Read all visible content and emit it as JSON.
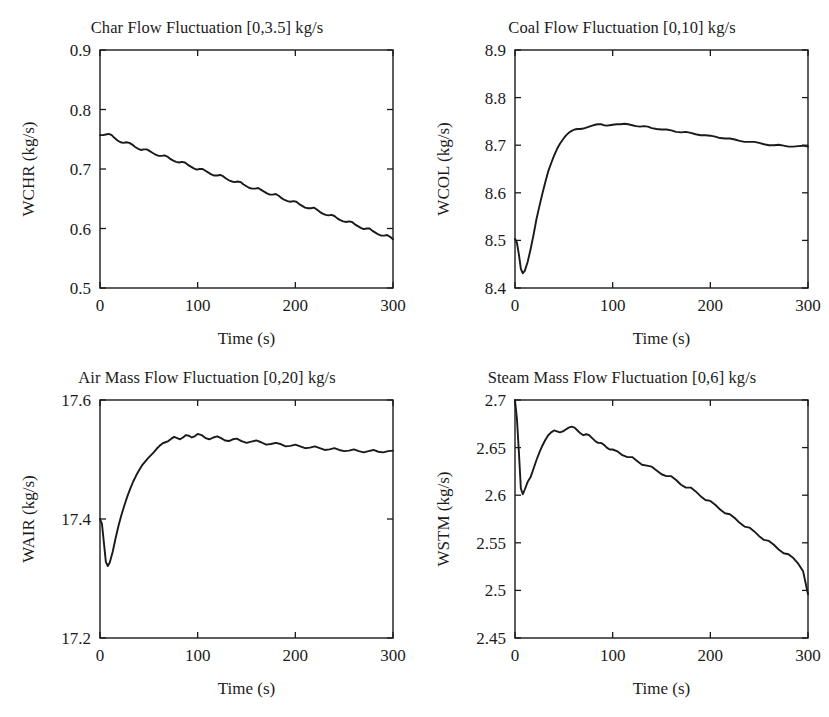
{
  "figure": {
    "width": 829,
    "height": 717,
    "background": "#ffffff",
    "line_color": "#1a1a1a",
    "axis_color": "#1a1a1a",
    "text_color": "#1b1b1b"
  },
  "chart_data": [
    {
      "id": "char-flow",
      "type": "line",
      "title": "Char Flow Fluctuation [0,3.5] kg/s",
      "xlabel": "Time (s)",
      "ylabel": "WCHR (kg/s)",
      "xlim": [
        0,
        300
      ],
      "ylim": [
        0.5,
        0.9
      ],
      "xticks": [
        0,
        100,
        200,
        300
      ],
      "xticklabels": [
        "0",
        "100",
        "200",
        "300"
      ],
      "yticks": [
        0.5,
        0.6,
        0.7,
        0.8,
        0.9
      ],
      "yticklabels": [
        "0.5",
        "0.6",
        "0.7",
        "0.8",
        "0.9"
      ],
      "grid": false,
      "legend": null,
      "series": [
        {
          "name": "WCHR",
          "x": [
            0,
            3,
            6,
            9,
            12,
            15,
            18,
            21,
            24,
            27,
            30,
            33,
            36,
            39,
            42,
            45,
            48,
            51,
            54,
            57,
            60,
            63,
            66,
            69,
            72,
            75,
            78,
            81,
            84,
            87,
            90,
            93,
            96,
            99,
            102,
            105,
            108,
            111,
            114,
            117,
            120,
            123,
            126,
            129,
            132,
            135,
            138,
            141,
            144,
            147,
            150,
            153,
            156,
            159,
            162,
            165,
            168,
            171,
            174,
            177,
            180,
            183,
            186,
            189,
            192,
            195,
            198,
            201,
            204,
            207,
            210,
            213,
            216,
            219,
            222,
            225,
            228,
            231,
            234,
            237,
            240,
            243,
            246,
            249,
            252,
            255,
            258,
            261,
            264,
            267,
            270,
            273,
            276,
            279,
            282,
            285,
            288,
            291,
            294,
            297,
            300
          ],
          "y": [
            0.757,
            0.757,
            0.758,
            0.759,
            0.757,
            0.752,
            0.748,
            0.745,
            0.744,
            0.745,
            0.744,
            0.741,
            0.737,
            0.734,
            0.732,
            0.733,
            0.733,
            0.73,
            0.727,
            0.724,
            0.722,
            0.722,
            0.723,
            0.721,
            0.717,
            0.714,
            0.712,
            0.711,
            0.712,
            0.711,
            0.707,
            0.704,
            0.701,
            0.699,
            0.7,
            0.7,
            0.697,
            0.694,
            0.691,
            0.689,
            0.689,
            0.69,
            0.688,
            0.684,
            0.681,
            0.679,
            0.678,
            0.679,
            0.678,
            0.674,
            0.671,
            0.668,
            0.667,
            0.667,
            0.668,
            0.665,
            0.662,
            0.659,
            0.657,
            0.657,
            0.658,
            0.655,
            0.651,
            0.648,
            0.646,
            0.645,
            0.646,
            0.645,
            0.641,
            0.638,
            0.635,
            0.634,
            0.634,
            0.635,
            0.632,
            0.628,
            0.625,
            0.623,
            0.622,
            0.623,
            0.621,
            0.617,
            0.614,
            0.612,
            0.611,
            0.612,
            0.611,
            0.607,
            0.604,
            0.601,
            0.599,
            0.6,
            0.6,
            0.596,
            0.593,
            0.59,
            0.588,
            0.588,
            0.589,
            0.586,
            0.582
          ]
        }
      ]
    },
    {
      "id": "coal-flow",
      "type": "line",
      "title": "Coal Flow Fluctuation [0,10] kg/s",
      "xlabel": "Time (s)",
      "ylabel": "WCOL (kg/s)",
      "xlim": [
        0,
        300
      ],
      "ylim": [
        8.4,
        8.9
      ],
      "xticks": [
        0,
        100,
        200,
        300
      ],
      "xticklabels": [
        "0",
        "100",
        "200",
        "300"
      ],
      "yticks": [
        8.4,
        8.5,
        8.6,
        8.7,
        8.8,
        8.9
      ],
      "yticklabels": [
        "8.4",
        "8.5",
        "8.6",
        "8.7",
        "8.8",
        "8.9"
      ],
      "grid": false,
      "legend": null,
      "series": [
        {
          "name": "WCOL",
          "x": [
            0,
            2,
            4,
            6,
            8,
            10,
            13,
            16,
            19,
            22,
            25,
            28,
            31,
            34,
            37,
            40,
            43,
            46,
            49,
            52,
            55,
            58,
            61,
            64,
            67,
            70,
            73,
            76,
            79,
            82,
            85,
            88,
            91,
            94,
            97,
            100,
            104,
            108,
            112,
            116,
            120,
            124,
            128,
            132,
            136,
            140,
            145,
            150,
            155,
            160,
            165,
            170,
            175,
            180,
            185,
            190,
            195,
            200,
            205,
            210,
            215,
            220,
            225,
            230,
            235,
            240,
            245,
            250,
            255,
            260,
            265,
            270,
            275,
            280,
            285,
            290,
            295,
            300
          ],
          "y": [
            8.503,
            8.495,
            8.47,
            8.44,
            8.431,
            8.436,
            8.455,
            8.482,
            8.512,
            8.545,
            8.572,
            8.598,
            8.622,
            8.645,
            8.662,
            8.678,
            8.692,
            8.703,
            8.712,
            8.72,
            8.726,
            8.73,
            8.733,
            8.734,
            8.734,
            8.735,
            8.737,
            8.739,
            8.741,
            8.743,
            8.744,
            8.744,
            8.742,
            8.741,
            8.742,
            8.743,
            8.744,
            8.744,
            8.745,
            8.744,
            8.742,
            8.74,
            8.739,
            8.74,
            8.739,
            8.736,
            8.734,
            8.733,
            8.733,
            8.731,
            8.728,
            8.727,
            8.728,
            8.726,
            8.723,
            8.721,
            8.721,
            8.72,
            8.718,
            8.715,
            8.714,
            8.714,
            8.712,
            8.709,
            8.707,
            8.707,
            8.707,
            8.705,
            8.702,
            8.7,
            8.7,
            8.701,
            8.699,
            8.697,
            8.697,
            8.698,
            8.699,
            8.697
          ]
        }
      ]
    },
    {
      "id": "air-mass-flow",
      "type": "line",
      "title": "Air Mass Flow Fluctuation [0,20] kg/s",
      "xlabel": "Time (s)",
      "ylabel": "WAIR (kg/s)",
      "xlim": [
        0,
        300
      ],
      "ylim": [
        17.2,
        17.6
      ],
      "xticks": [
        0,
        100,
        200,
        300
      ],
      "xticklabels": [
        "0",
        "100",
        "200",
        "300"
      ],
      "yticks": [
        17.2,
        17.4,
        17.6
      ],
      "yticklabels": [
        "17.2",
        "17.4",
        "17.6"
      ],
      "grid": false,
      "legend": null,
      "series": [
        {
          "name": "WAIR",
          "x": [
            0,
            2,
            4,
            6,
            8,
            10,
            13,
            16,
            19,
            22,
            25,
            28,
            31,
            34,
            37,
            40,
            43,
            46,
            49,
            52,
            55,
            58,
            61,
            64,
            67,
            70,
            73,
            76,
            79,
            82,
            85,
            88,
            91,
            94,
            97,
            100,
            104,
            108,
            112,
            116,
            120,
            124,
            128,
            132,
            136,
            140,
            145,
            150,
            155,
            160,
            165,
            170,
            175,
            180,
            185,
            190,
            195,
            200,
            205,
            210,
            215,
            220,
            225,
            230,
            235,
            240,
            245,
            250,
            255,
            260,
            265,
            270,
            275,
            280,
            285,
            290,
            295,
            300
          ],
          "y": [
            17.4,
            17.392,
            17.36,
            17.328,
            17.321,
            17.327,
            17.345,
            17.368,
            17.389,
            17.407,
            17.423,
            17.438,
            17.451,
            17.463,
            17.473,
            17.482,
            17.49,
            17.496,
            17.502,
            17.507,
            17.512,
            17.518,
            17.523,
            17.527,
            17.529,
            17.531,
            17.535,
            17.538,
            17.536,
            17.534,
            17.537,
            17.541,
            17.54,
            17.537,
            17.539,
            17.543,
            17.541,
            17.536,
            17.534,
            17.537,
            17.539,
            17.536,
            17.532,
            17.531,
            17.534,
            17.535,
            17.531,
            17.528,
            17.53,
            17.532,
            17.529,
            17.525,
            17.526,
            17.528,
            17.526,
            17.522,
            17.523,
            17.525,
            17.522,
            17.519,
            17.52,
            17.522,
            17.519,
            17.516,
            17.517,
            17.519,
            17.516,
            17.514,
            17.515,
            17.517,
            17.514,
            17.512,
            17.514,
            17.516,
            17.513,
            17.512,
            17.514,
            17.515
          ]
        }
      ]
    },
    {
      "id": "steam-mass-flow",
      "type": "line",
      "title": "Steam Mass Flow Fluctuation [0,6] kg/s",
      "xlabel": "Time (s)",
      "ylabel": "WSTM (kg/s)",
      "xlim": [
        0,
        300
      ],
      "ylim": [
        2.45,
        2.7
      ],
      "xticks": [
        0,
        100,
        200,
        300
      ],
      "xticklabels": [
        "0",
        "100",
        "200",
        "300"
      ],
      "yticks": [
        2.45,
        2.5,
        2.55,
        2.6,
        2.65,
        2.7
      ],
      "yticklabels": [
        "2.45",
        "2.5",
        "2.55",
        "2.6",
        "2.65",
        "2.7"
      ],
      "grid": false,
      "legend": null,
      "series": [
        {
          "name": "WSTM",
          "x": [
            0,
            2,
            4,
            6,
            8,
            10,
            13,
            16,
            19,
            22,
            25,
            28,
            31,
            34,
            37,
            40,
            43,
            46,
            49,
            52,
            55,
            58,
            61,
            64,
            67,
            70,
            73,
            76,
            79,
            82,
            85,
            88,
            91,
            94,
            97,
            100,
            105,
            110,
            115,
            120,
            125,
            130,
            135,
            140,
            145,
            150,
            155,
            160,
            165,
            170,
            175,
            180,
            185,
            190,
            195,
            200,
            205,
            210,
            215,
            220,
            225,
            230,
            235,
            240,
            245,
            250,
            255,
            260,
            265,
            270,
            275,
            280,
            285,
            290,
            295,
            300
          ],
          "y": [
            2.7,
            2.68,
            2.645,
            2.607,
            2.601,
            2.606,
            2.614,
            2.619,
            2.628,
            2.637,
            2.645,
            2.652,
            2.658,
            2.663,
            2.666,
            2.668,
            2.667,
            2.666,
            2.667,
            2.669,
            2.671,
            2.672,
            2.671,
            2.668,
            2.665,
            2.663,
            2.664,
            2.663,
            2.66,
            2.657,
            2.655,
            2.655,
            2.653,
            2.65,
            2.648,
            2.648,
            2.646,
            2.642,
            2.64,
            2.64,
            2.636,
            2.632,
            2.631,
            2.63,
            2.626,
            2.622,
            2.62,
            2.62,
            2.616,
            2.611,
            2.608,
            2.608,
            2.604,
            2.599,
            2.595,
            2.594,
            2.59,
            2.585,
            2.581,
            2.58,
            2.576,
            2.571,
            2.567,
            2.566,
            2.562,
            2.557,
            2.553,
            2.552,
            2.548,
            2.543,
            2.539,
            2.538,
            2.534,
            2.528,
            2.52,
            2.496
          ]
        }
      ]
    }
  ]
}
